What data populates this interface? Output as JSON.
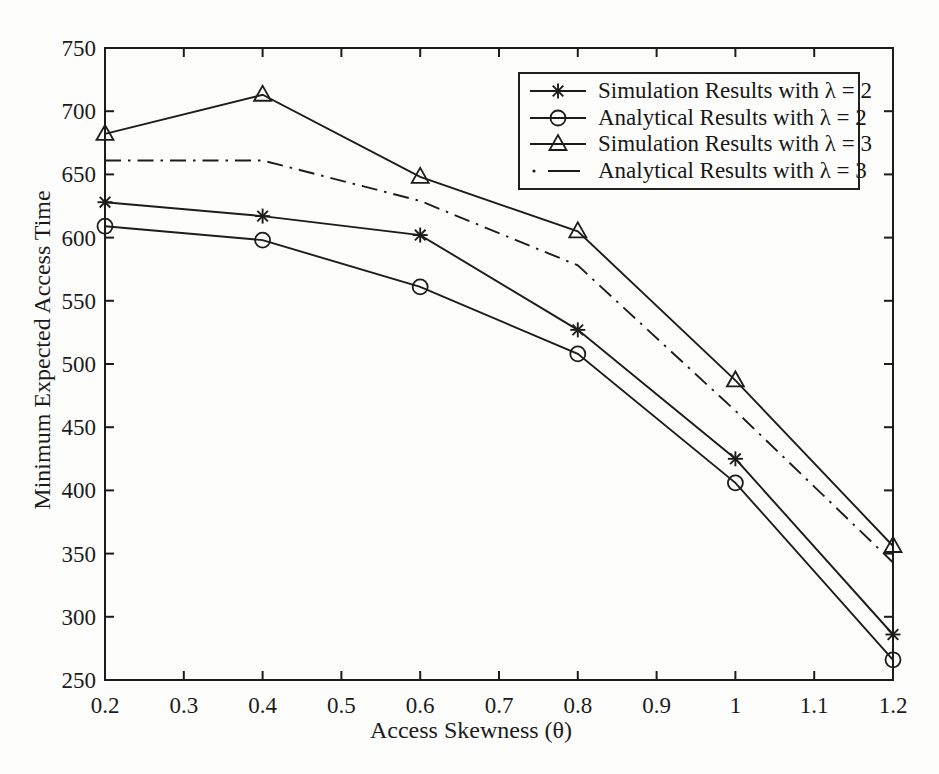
{
  "chart_data": {
    "type": "line",
    "title": "",
    "xlabel": "Access Skewness (θ)",
    "ylabel": "Minimum Expected Access Time",
    "xlim": [
      0.2,
      1.2
    ],
    "ylim": [
      250,
      750
    ],
    "xticks": [
      0.2,
      0.3,
      0.4,
      0.5,
      0.6,
      0.7,
      0.8,
      0.9,
      1,
      1.1,
      1.2
    ],
    "xtick_labels": [
      "0.2",
      "0.3",
      "0.4",
      "0.5",
      "0.6",
      "0.7",
      "0.8",
      "0.9",
      "1",
      "1.1",
      "1.2"
    ],
    "yticks": [
      250,
      300,
      350,
      400,
      450,
      500,
      550,
      600,
      650,
      700,
      750
    ],
    "ytick_labels": [
      "250",
      "300",
      "350",
      "400",
      "450",
      "500",
      "550",
      "600",
      "650",
      "700",
      "750"
    ],
    "grid": false,
    "legend_position": "upper-right",
    "line_color": "#1c1c1c",
    "background_color": "#fdfdfc",
    "x": [
      0.2,
      0.4,
      0.6,
      0.8,
      1.0,
      1.2
    ],
    "series": [
      {
        "name": "Simulation Results with λ = 2",
        "marker": "star",
        "linestyle": "solid",
        "values": [
          628,
          617,
          602,
          527,
          425,
          286
        ]
      },
      {
        "name": "Analytical Results with λ = 2",
        "marker": "circle",
        "linestyle": "solid",
        "values": [
          609,
          598,
          561,
          508,
          406,
          266
        ]
      },
      {
        "name": "Simulation Results with λ = 3",
        "marker": "triangle",
        "linestyle": "solid",
        "values": [
          682,
          713,
          648,
          605,
          487,
          356
        ]
      },
      {
        "name": "Analytical Results with λ = 3",
        "marker": "none",
        "linestyle": "dashdot",
        "values": [
          661,
          661,
          629,
          578,
          463,
          343
        ]
      }
    ]
  }
}
